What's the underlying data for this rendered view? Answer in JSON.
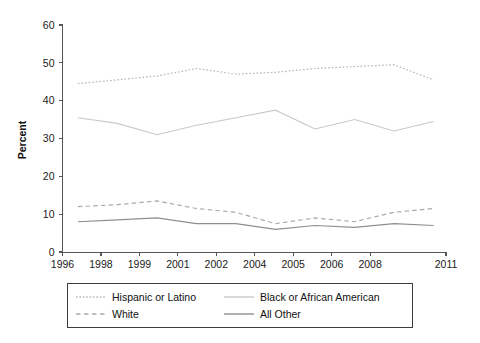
{
  "chart_data": {
    "type": "line",
    "title": "",
    "subtitle": "",
    "xlabel": "",
    "ylabel": "Percent",
    "ylim": [
      0,
      60
    ],
    "yticks": [
      0,
      10,
      20,
      30,
      40,
      50,
      60
    ],
    "ytick_labels": [
      "0",
      "10",
      "20",
      "30",
      "40",
      "50",
      "60"
    ],
    "categories": [
      "1996",
      "1998",
      "1999",
      "2001",
      "2002",
      "2004",
      "2005",
      "2006",
      "2008",
      "2011"
    ],
    "xtick_labels": [
      "1996",
      "1998",
      "1999",
      "2001",
      "2002",
      "2004",
      "2005",
      "2006",
      "2008",
      "2011"
    ],
    "grid": false,
    "legend_position": "bottom",
    "series": [
      {
        "name": "Hispanic or Latino",
        "linestyle": "dotted",
        "color": "#b9b9b9",
        "width": 1.2,
        "values": [
          44.5,
          45.5,
          46.5,
          48.5,
          47.0,
          47.5,
          48.5,
          49.0,
          49.5,
          45.5
        ]
      },
      {
        "name": "Black or African American",
        "linestyle": "solid",
        "color": "#c9c9c9",
        "width": 1.1,
        "values": [
          35.5,
          34.0,
          31.0,
          33.5,
          35.5,
          37.5,
          32.5,
          35.0,
          32.0,
          34.5
        ]
      },
      {
        "name": "White",
        "linestyle": "dashed",
        "color": "#aaaaaa",
        "width": 1.2,
        "values": [
          12.0,
          12.5,
          13.5,
          11.5,
          10.5,
          7.5,
          9.0,
          8.0,
          10.5,
          11.5
        ]
      },
      {
        "name": "All Other",
        "linestyle": "solid",
        "color": "#8f8f8f",
        "width": 1.2,
        "values": [
          8.0,
          8.5,
          9.0,
          7.5,
          7.5,
          6.0,
          7.0,
          6.5,
          7.5,
          7.0
        ]
      }
    ],
    "data_start_index": 0,
    "data_end_index": 9
  },
  "legend": {
    "entries": [
      {
        "label": "Hispanic or Latino",
        "linestyle": "dotted",
        "color": "#b9b9b9"
      },
      {
        "label": "Black or African American",
        "linestyle": "solid",
        "color": "#c9c9c9"
      },
      {
        "label": "White",
        "linestyle": "dashed",
        "color": "#aaaaaa"
      },
      {
        "label": "All Other",
        "linestyle": "solid",
        "color": "#8f8f8f"
      }
    ]
  },
  "axes": {
    "y_title": "Percent"
  },
  "colors": {
    "axis": "#555555",
    "text": "#111111",
    "background": "#ffffff",
    "legend_border": "#3d3d3d"
  }
}
